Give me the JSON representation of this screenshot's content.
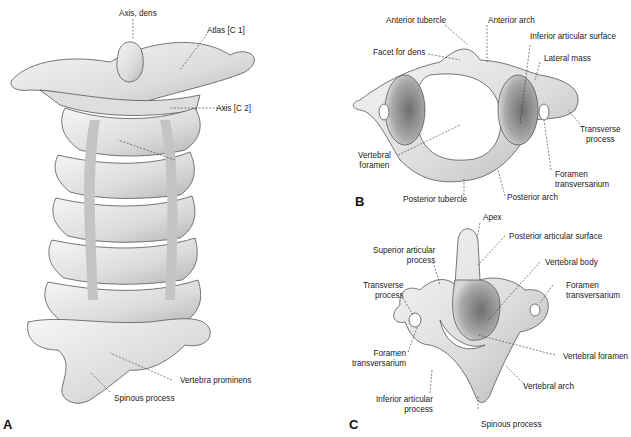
{
  "figure": {
    "panels": [
      {
        "id": "A",
        "label": "A",
        "title": "Cervical spine, posterior view",
        "annotations": [
          "Axis, dens",
          "Atlas [C 1]",
          "Axis [C 2]",
          "Vertebra prominens",
          "Spinous process"
        ]
      },
      {
        "id": "B",
        "label": "B",
        "title": "Atlas, superior view",
        "annotations": [
          "Anterior tubercle",
          "Anterior arch",
          "Facet for dens",
          "Inferior articular surface",
          "Lateral mass",
          "Transverse process",
          "Vertebral foramen",
          "Foramen transversarium",
          "Posterior tubercle",
          "Posterior arch"
        ]
      },
      {
        "id": "C",
        "label": "C",
        "title": "Axis, posterosuperior view",
        "annotations": [
          "Apex",
          "Posterior articular surface",
          "Superior articular process",
          "Vertebral body",
          "Transverse process",
          "Foramen transversarium",
          "Foramen transversarium",
          "Vertebral foramen",
          "Vertebral arch",
          "Inferior articular process",
          "Spinous process"
        ]
      }
    ]
  },
  "labels": {
    "a_axis_dens": "Axis, dens",
    "a_atlas": "Atlas [C 1]",
    "a_axis": "Axis [C 2]",
    "a_prominens": "Vertebra prominens",
    "a_spinous": "Spinous process",
    "b_ant_tubercle": "Anterior tubercle",
    "b_ant_arch": "Anterior arch",
    "b_facet_dens": "Facet for dens",
    "b_inf_artic": "Inferior articular surface",
    "b_lateral_mass": "Lateral mass",
    "b_transverse_1": "Transverse",
    "b_transverse_2": "process",
    "b_vert_foramen_1": "Vertebral",
    "b_vert_foramen_2": "foramen",
    "b_foramen_trans_1": "Foramen",
    "b_foramen_trans_2": "transversarium",
    "b_post_tubercle": "Posterior tubercle",
    "b_post_arch": "Posterior arch",
    "c_apex": "Apex",
    "c_post_artic": "Posterior articular surface",
    "c_sup_artic_1": "Superior articular",
    "c_sup_artic_2": "process",
    "c_vert_body": "Vertebral body",
    "c_transverse_1": "Transverse",
    "c_transverse_2": "process",
    "c_foramen_r_1": "Foramen",
    "c_foramen_r_2": "transversarium",
    "c_foramen_l_1": "Foramen",
    "c_foramen_l_2": "transversarium",
    "c_vert_foramen": "Vertebral foramen",
    "c_vert_arch": "Vertebral arch",
    "c_inf_artic_1": "Inferior articular",
    "c_inf_artic_2": "process",
    "c_spinous": "Spinous process"
  },
  "colors": {
    "bone": "#e9e9e9",
    "shade": "#9a9a9a",
    "outline": "#555555",
    "text": "#222222"
  }
}
